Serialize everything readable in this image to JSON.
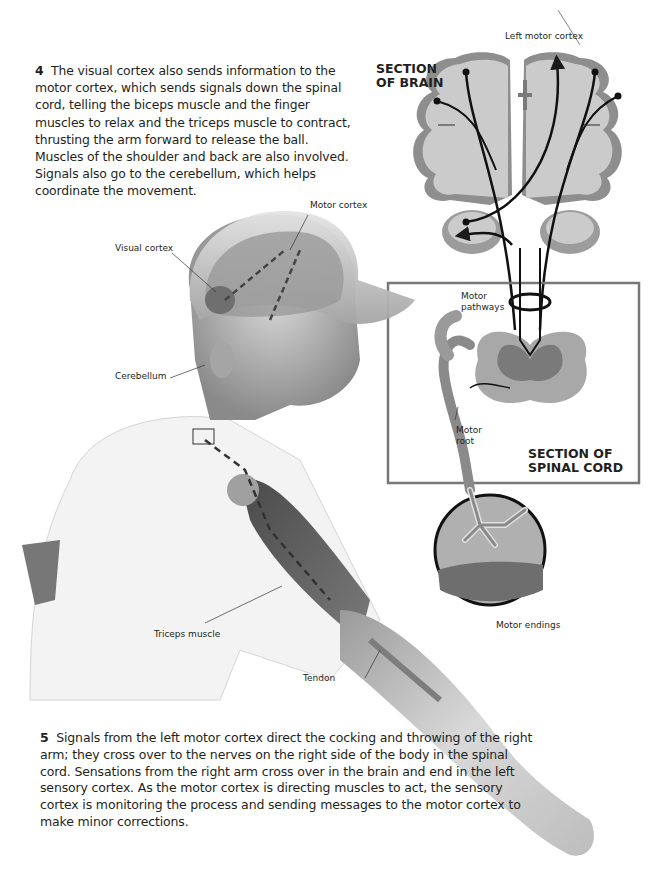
{
  "paragraphs": {
    "step4": {
      "number": "4",
      "text": "The visual cortex also sends information to the motor cortex, which sends signals down the spinal cord, telling the biceps muscle and the finger muscles to relax and the triceps muscle to contract, thrusting the arm forward to release the ball. Muscles of the shoulder and back are also involved. Signals also go to the cerebellum, which helps coordinate the movement."
    },
    "step5": {
      "number": "5",
      "text": "Signals from the left motor cortex direct the cocking and throwing of the right arm; they cross over to the nerves on the right side of the body in the spinal cord. Sensations from the right arm cross over in the brain and end in the left sensory cortex. As the motor cortex is directing muscles to act, the sensory cortex is monitoring the process and sending messages to the motor cortex to make minor corrections."
    }
  },
  "section_headings": {
    "brain": [
      "SECTION",
      "OF BRAIN"
    ],
    "spinal_cord": [
      "SECTION OF",
      "SPINAL CORD"
    ]
  },
  "labels": {
    "left_motor_cortex": "Left motor cortex",
    "motor_cortex": "Motor cortex",
    "visual_cortex": "Visual cortex",
    "cerebellum": "Cerebellum",
    "motor_pathways": [
      "Motor",
      "pathways"
    ],
    "motor_root": [
      "Motor",
      "root"
    ],
    "motor_endings": "Motor endings",
    "triceps_muscle": "Triceps muscle",
    "tendon": "Tendon"
  },
  "colors": {
    "text": "#231f20",
    "brain_gray": "#c9c9c9",
    "cortex_dark": "#8e8e8e",
    "outline": "#6b6b6b",
    "skin": "#b8b8b8"
  }
}
